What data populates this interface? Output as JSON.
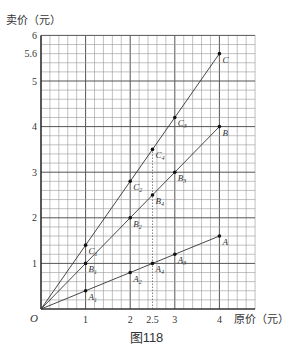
{
  "figure": {
    "caption": "图118"
  },
  "chart_data": {
    "type": "line",
    "title": "",
    "xlabel": "原价（元）",
    "ylabel": "卖价（元）",
    "origin_label": "O",
    "xlim": [
      0,
      4.8
    ],
    "ylim": [
      0,
      6
    ],
    "grid": true,
    "grid_minor_step": 0.2,
    "x_ticks": [
      {
        "value": 1,
        "label": "1"
      },
      {
        "value": 2,
        "label": "2"
      },
      {
        "value": 2.5,
        "label": "2.5"
      },
      {
        "value": 3,
        "label": "3"
      },
      {
        "value": 4,
        "label": "4"
      }
    ],
    "y_ticks": [
      {
        "value": 1,
        "label": "1"
      },
      {
        "value": 2,
        "label": "2"
      },
      {
        "value": 3,
        "label": "3"
      },
      {
        "value": 4,
        "label": "4"
      },
      {
        "value": 5,
        "label": "5"
      },
      {
        "value": 5.6,
        "label": "5.6"
      },
      {
        "value": 6,
        "label": "6"
      }
    ],
    "dotted_vertical": [
      2.5
    ],
    "series": [
      {
        "name": "A",
        "points": [
          {
            "x": 1,
            "y": 0.4,
            "label": "A1"
          },
          {
            "x": 2,
            "y": 0.8,
            "label": "A2"
          },
          {
            "x": 2.5,
            "y": 1.0,
            "label": "A4"
          },
          {
            "x": 3,
            "y": 1.2,
            "label": "A3"
          },
          {
            "x": 4,
            "y": 1.6,
            "label": "A"
          }
        ]
      },
      {
        "name": "B",
        "points": [
          {
            "x": 1,
            "y": 1.0,
            "label": "B1"
          },
          {
            "x": 2,
            "y": 2.0,
            "label": "B2"
          },
          {
            "x": 2.5,
            "y": 2.5,
            "label": "B4"
          },
          {
            "x": 3,
            "y": 3.0,
            "label": "B3"
          },
          {
            "x": 4,
            "y": 4.0,
            "label": "B"
          }
        ]
      },
      {
        "name": "C",
        "points": [
          {
            "x": 1,
            "y": 1.4,
            "label": "C1"
          },
          {
            "x": 2,
            "y": 2.8,
            "label": "C2"
          },
          {
            "x": 2.5,
            "y": 3.5,
            "label": "C4"
          },
          {
            "x": 3,
            "y": 4.2,
            "label": "C3"
          },
          {
            "x": 4,
            "y": 5.6,
            "label": "C"
          }
        ]
      }
    ]
  }
}
